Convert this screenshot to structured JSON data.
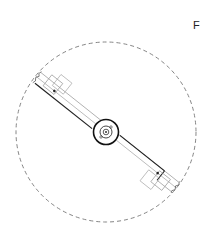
{
  "figure": {
    "label": "F",
    "colors": {
      "line": "#222222",
      "thin_line": "#888888",
      "dashed": "#777777",
      "background": "#ffffff"
    }
  }
}
